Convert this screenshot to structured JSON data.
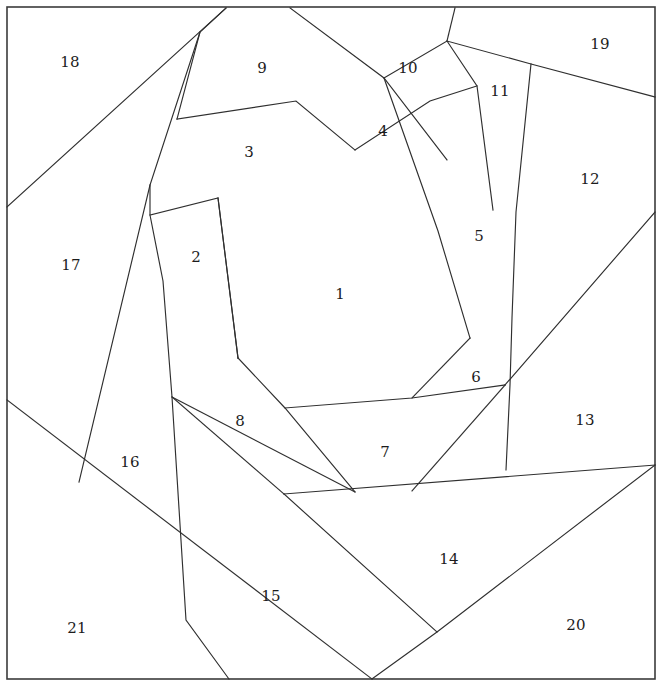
{
  "figure": {
    "type": "line-diagram",
    "width": 671,
    "height": 687,
    "background_color": "#ffffff",
    "line_color": "#2f2f2f",
    "frame_color": "#3b3b3b",
    "label_color": "#1c1c1c",
    "piece_count": 21
  },
  "frame": {
    "x": 7,
    "y": 7,
    "width": 648,
    "height": 672
  },
  "labels": [
    {
      "text": "1",
      "x": 340,
      "y": 294
    },
    {
      "text": "2",
      "x": 196,
      "y": 257
    },
    {
      "text": "3",
      "x": 249,
      "y": 152
    },
    {
      "text": "4",
      "x": 383,
      "y": 131
    },
    {
      "text": "5",
      "x": 479,
      "y": 236
    },
    {
      "text": "6",
      "x": 476,
      "y": 377
    },
    {
      "text": "7",
      "x": 385,
      "y": 452
    },
    {
      "text": "8",
      "x": 240,
      "y": 421
    },
    {
      "text": "9",
      "x": 262,
      "y": 68
    },
    {
      "text": "10",
      "x": 408,
      "y": 68
    },
    {
      "text": "11",
      "x": 500,
      "y": 91
    },
    {
      "text": "12",
      "x": 590,
      "y": 179
    },
    {
      "text": "13",
      "x": 585,
      "y": 420
    },
    {
      "text": "14",
      "x": 449,
      "y": 559
    },
    {
      "text": "15",
      "x": 271,
      "y": 596
    },
    {
      "text": "16",
      "x": 130,
      "y": 462
    },
    {
      "text": "17",
      "x": 71,
      "y": 265
    },
    {
      "text": "18",
      "x": 70,
      "y": 62
    },
    {
      "text": "19",
      "x": 600,
      "y": 44
    },
    {
      "text": "20",
      "x": 576,
      "y": 625
    },
    {
      "text": "21",
      "x": 77,
      "y": 628
    }
  ],
  "cut_lines": [
    {
      "name": "cut-18-17",
      "points": "7,207 226,8"
    },
    {
      "name": "cut-9-3-left",
      "points": "226,8 200,32 177,119"
    },
    {
      "name": "cut-3-top",
      "points": "177,119 296,101 355,150"
    },
    {
      "name": "cut-17-2-spine",
      "points": "200,32 150,185 150,215 163,281 172,397 186,620 229,679"
    },
    {
      "name": "cut-2-3-bottom",
      "points": "150,215 218,198 238,358"
    },
    {
      "name": "cut-2-right",
      "points": "218,198 238,358"
    },
    {
      "name": "cut-16-17",
      "points": "150,185 79,482"
    },
    {
      "name": "cut-16-21",
      "points": "7,400 372,679"
    },
    {
      "name": "cut-16-15",
      "points": "172,397 284,494"
    },
    {
      "name": "cut-8-1",
      "points": "238,358 285,408 355,492"
    },
    {
      "name": "cut-8-15",
      "points": "172,397 355,492"
    },
    {
      "name": "cut-inner-bottom",
      "points": "285,408 412,398 505,385"
    },
    {
      "name": "cut-9-10",
      "points": "290,8 384,78 447,160"
    },
    {
      "name": "cut-4-1",
      "points": "355,150 430,101 477,86"
    },
    {
      "name": "cut-4-5",
      "points": "384,78 438,231 470,338"
    },
    {
      "name": "cut-10-11",
      "points": "447,41 477,86 493,210"
    },
    {
      "name": "cut-11-right",
      "points": "447,41 455,8"
    },
    {
      "name": "cut-10-19",
      "points": "384,78 447,41 531,64 655,97"
    },
    {
      "name": "cut-11-12",
      "points": "531,64 516,212 512,318 510,385 506,470"
    },
    {
      "name": "cut-5-6",
      "points": "470,338 412,398"
    },
    {
      "name": "cut-12-13",
      "points": "655,212 505,385"
    },
    {
      "name": "cut-6-7",
      "points": "505,385 412,491"
    },
    {
      "name": "cut-7-14-base",
      "points": "284,494 655,465"
    },
    {
      "name": "cut-14-20",
      "points": "655,465 437,632 372,679"
    },
    {
      "name": "cut-14-15",
      "points": "284,494 437,632"
    }
  ]
}
